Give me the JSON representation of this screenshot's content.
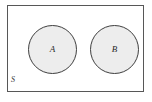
{
  "diagram": {
    "type": "venn",
    "universe": {
      "label": "S",
      "shape": "rectangle",
      "border_color": "#575757",
      "fill_color": "#ffffff"
    },
    "sets": [
      {
        "label": "A",
        "shape": "circle",
        "fill_color": "#ededed",
        "border_color": "#3f3f3f"
      },
      {
        "label": "B",
        "shape": "circle",
        "fill_color": "#ededed",
        "border_color": "#3f3f3f"
      }
    ],
    "relationship": "disjoint"
  }
}
